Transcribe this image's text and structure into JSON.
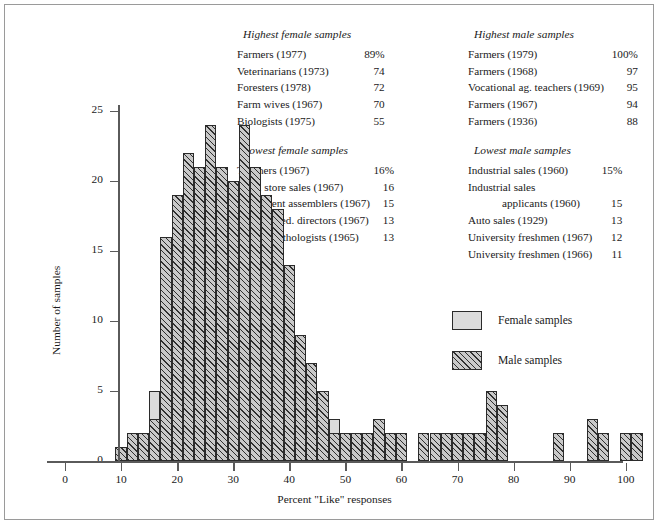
{
  "chart_data": {
    "type": "bar",
    "title": "",
    "xlabel": "Percent \"Like\" responses",
    "ylabel": "Number of samples",
    "xlim": [
      0,
      102
    ],
    "ylim": [
      0,
      25
    ],
    "xticks": [
      0,
      10,
      20,
      30,
      40,
      50,
      60,
      70,
      80,
      90,
      100
    ],
    "yticks": [
      0,
      5,
      10,
      15,
      20,
      25
    ],
    "grid": false,
    "legend_position": "inside-right",
    "bin_width": 2,
    "series": [
      {
        "name": "Female samples",
        "color": "#dcdcdc",
        "x": [
          9,
          11,
          13,
          15,
          17,
          19,
          21,
          23,
          25,
          27,
          29,
          31,
          33,
          35,
          37,
          39,
          41,
          43,
          45,
          47,
          49,
          51,
          53,
          55,
          57,
          59,
          61,
          63,
          65,
          67,
          69,
          71,
          73,
          75,
          77
        ],
        "values": [
          0,
          0,
          2,
          5,
          7,
          10,
          13,
          10,
          12,
          15,
          17,
          12,
          12,
          13,
          10,
          8,
          5,
          3,
          3,
          3,
          2,
          1,
          1,
          1,
          0,
          0,
          0,
          0,
          0,
          1,
          0,
          1,
          1,
          0,
          0
        ]
      },
      {
        "name": "Male samples",
        "color": "#c9c9c9",
        "x": [
          9,
          11,
          13,
          15,
          17,
          19,
          21,
          23,
          25,
          27,
          29,
          31,
          33,
          35,
          37,
          39,
          41,
          43,
          45,
          47,
          49,
          51,
          53,
          55,
          57,
          59,
          61,
          63,
          65,
          67,
          69,
          71,
          73,
          75,
          77,
          87,
          89,
          93,
          95,
          99,
          101
        ],
        "values": [
          1,
          2,
          2,
          3,
          16,
          19,
          22,
          21,
          24,
          21,
          20,
          24,
          21,
          19,
          18,
          14,
          9,
          7,
          5,
          2,
          2,
          2,
          2,
          3,
          2,
          2,
          0,
          2,
          2,
          2,
          2,
          2,
          2,
          5,
          4,
          2,
          0,
          3,
          2,
          2,
          2
        ]
      }
    ]
  },
  "panels": {
    "highest_female": {
      "title": "Highest female samples",
      "rows": [
        {
          "name": "Farmers (1977)",
          "value": "89%"
        },
        {
          "name": "Veterinarians (1973)",
          "value": "74"
        },
        {
          "name": "Foresters (1978)",
          "value": "72"
        },
        {
          "name": "Farm wives (1967)",
          "value": "70"
        },
        {
          "name": "Biologists (1975)",
          "value": "55"
        }
      ]
    },
    "highest_male": {
      "title": "Highest male samples",
      "rows": [
        {
          "name": "Farmers (1979)",
          "value": "100%"
        },
        {
          "name": "Farmers (1968)",
          "value": "97"
        },
        {
          "name": "Vocational ag. teachers (1969)",
          "value": "95"
        },
        {
          "name": "Farmers (1967)",
          "value": "94"
        },
        {
          "name": "Farmers (1936)",
          "value": "88"
        }
      ]
    },
    "lowest_female": {
      "title": "Lowest female samples",
      "rows": [
        {
          "name": "Teachers (1967)",
          "value": "16%"
        },
        {
          "name": "Dept. store sales (1967)",
          "value": "16"
        },
        {
          "name": "Instrument assemblers (1967)",
          "value": "15"
        },
        {
          "name": "Christian ed. directors (1967)",
          "value": "13"
        },
        {
          "name": "Speech pathologists (1965)",
          "value": "13"
        }
      ]
    },
    "lowest_male": {
      "title": "Lowest male samples",
      "rows": [
        {
          "name": "Industrial sales (1960)",
          "value": "15%"
        },
        {
          "name": "Industrial sales",
          "value": ""
        },
        {
          "name": "applicants (1960)",
          "value": "15",
          "indent": true
        },
        {
          "name": "Auto sales (1929)",
          "value": "13"
        },
        {
          "name": "University freshmen (1967)",
          "value": "12"
        },
        {
          "name": "University freshmen (1966)",
          "value": "11"
        }
      ]
    }
  },
  "legend": {
    "female_label": "Female samples",
    "male_label": "Male samples"
  }
}
